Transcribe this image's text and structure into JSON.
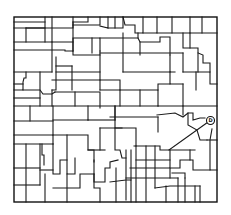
{
  "map": {
    "type": "county-parcel-boundary-map",
    "stroke_color": "#1a1a1a",
    "background_color": "#ffffff",
    "marker": {
      "label": "D",
      "description": "circled location marker on east boundary"
    }
  }
}
